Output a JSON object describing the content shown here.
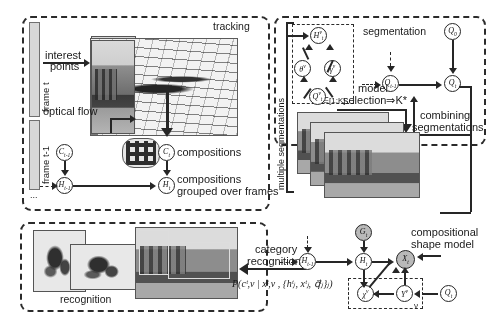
{
  "figure": {
    "type": "pipeline-graphical-model"
  },
  "modules": {
    "tracking": {
      "label": "tracking"
    },
    "segmentation": {
      "label": "segmentation"
    },
    "recognition": {
      "label": "recognition"
    }
  },
  "tracking": {
    "frame_t_label": "frame t",
    "frame_tm1_label": "frame t-1",
    "ellipsis": "...",
    "interest_points": "interest\npoints",
    "interest_points_line1": "interest",
    "interest_points_line2": "points",
    "optical_flow": "optical flow",
    "compositions": "compositions",
    "grouped_line1": "compositions",
    "grouped_line2": "grouped over frames",
    "nodes": [
      {
        "name": "C_prev",
        "base": "C",
        "sup": "",
        "sub": "t-1",
        "shaded": false
      },
      {
        "name": "H_prev",
        "base": "H",
        "sup": "",
        "sub": "t-1",
        "shaded": false
      },
      {
        "name": "C_t",
        "base": "C",
        "sup": "",
        "sub": "t",
        "shaded": false
      },
      {
        "name": "H_t",
        "base": "H",
        "sup": "",
        "sub": "t",
        "shaded": false
      }
    ]
  },
  "segmentation": {
    "plate_label": "multiple segmentations",
    "plate_index": "ν∈[1:K]",
    "model_selection_line1": "model",
    "model_selection_line2": "selection⇒K*",
    "combining_line1": "combining",
    "combining_line2": "segmentations",
    "nodes": [
      {
        "name": "H_t_nu",
        "base": "H",
        "sup": "ν",
        "sub": "t",
        "shaded": false
      },
      {
        "name": "theta_nu",
        "base": "θ",
        "sup": "ν",
        "sub": "",
        "shaded": false
      },
      {
        "name": "gamma_nu",
        "base": "γ",
        "sup": "ν",
        "sub": "",
        "shaded": false
      },
      {
        "name": "Q_t_nu",
        "base": "Q",
        "sup": "ν",
        "sub": "t",
        "shaded": false
      },
      {
        "name": "Q_prev",
        "base": "Q",
        "sup": "",
        "sub": "t-1",
        "shaded": false
      },
      {
        "name": "Q_top",
        "base": "Q",
        "sup": "",
        "sub": "0",
        "shaded": false
      },
      {
        "name": "Q_t",
        "base": "Q",
        "sup": "",
        "sub": "t",
        "shaded": false
      }
    ]
  },
  "recognition": {
    "category_line1": "category",
    "category_line2": "recognition",
    "formula": "P(cᵗ,ν | xᵗ,ν , {hᵗⱼ, xᵗⱼ, q⃗ᵗⱼ}ⱼ)",
    "formula_plain": "P(c^{t,v}|x^{t,v},{h^t_j, x^t_j, q^t_j}_j)",
    "shape_model_line1": "compositional",
    "shape_model_line2": "shape model",
    "nodes": [
      {
        "name": "H_prev_rec",
        "base": "H",
        "sup": "",
        "sub": "t-1",
        "shaded": false
      },
      {
        "name": "H_t_rec",
        "base": "H",
        "sup": "",
        "sub": "t",
        "shaded": false
      },
      {
        "name": "G_t",
        "base": "G",
        "sup": "",
        "sub": "t",
        "shaded": true
      },
      {
        "name": "X_t",
        "base": "X",
        "sup": "",
        "sub": "t",
        "shaded": true
      },
      {
        "name": "chi_nu",
        "base": "χ",
        "sup": "ν",
        "sub": "",
        "shaded": false
      },
      {
        "name": "Y_nu",
        "base": "Y",
        "sup": "ν",
        "sub": "",
        "shaded": false
      },
      {
        "name": "Q_t_rec",
        "base": "Q",
        "sup": "",
        "sub": "t",
        "shaded": false
      }
    ],
    "plate_index": "ν"
  },
  "colors": {
    "stroke": "#262626",
    "shaded_node": "#b9b9b9",
    "panel_fill": "#d8d8d8",
    "background": "#ffffff"
  }
}
